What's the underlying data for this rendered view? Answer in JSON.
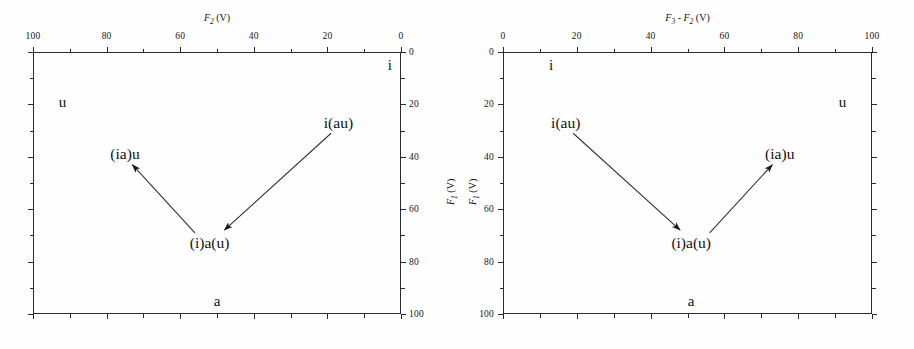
{
  "figure": {
    "background": "#fefefe",
    "ink": "#1a1a1a"
  },
  "chart_data": {
    "type": "scatter",
    "title": "",
    "grid": false,
    "legend": null,
    "panels": [
      {
        "id": "left",
        "xlabel": "F2 (V)",
        "xlabel_parts": {
          "symbol": "F",
          "sub": "2",
          "unit": "(V)"
        },
        "ylabel": "F1 (V)",
        "ylabel_parts": {
          "symbol": "F",
          "sub": "1",
          "unit": "(V)"
        },
        "xaxis_position": "top",
        "yaxis_position": "right",
        "xlim": [
          100,
          0
        ],
        "ylim": [
          0,
          100
        ],
        "x_reversed": true,
        "xticks": [
          100,
          80,
          60,
          40,
          20,
          0
        ],
        "yticks": [
          0,
          20,
          40,
          60,
          80,
          100
        ],
        "minor_tick_step": 10,
        "corner_labels": [
          {
            "text": "i",
            "x": 97,
            "y": 5
          },
          {
            "text": "u",
            "x": 8,
            "y": 19
          },
          {
            "text": "a",
            "x": 50,
            "y": 95
          }
        ],
        "points": [
          {
            "label": "i(au)",
            "x": 83,
            "y": 27
          },
          {
            "label": "(i)a(u)",
            "x": 48,
            "y": 73
          },
          {
            "label": "(ia)u",
            "x": 25,
            "y": 39
          }
        ],
        "arrows": [
          {
            "from": "i(au)",
            "to": "(i)a(u)",
            "x1": 81,
            "y1": 31,
            "x2": 52,
            "y2": 68
          },
          {
            "from": "(i)a(u)",
            "to": "(ia)u",
            "x1": 44,
            "y1": 69,
            "x2": 27,
            "y2": 43
          }
        ]
      },
      {
        "id": "right",
        "xlabel": "F3 - F2 (V)",
        "xlabel_parts": {
          "symbol1": "F",
          "sub1": "3",
          "op": "-",
          "symbol2": "F",
          "sub2": "2",
          "unit": "(V)"
        },
        "ylabel": "F1 (V)",
        "ylabel_parts": {
          "symbol": "F",
          "sub": "1",
          "unit": "(V)"
        },
        "xaxis_position": "top",
        "yaxis_position": "left",
        "xlim": [
          0,
          100
        ],
        "ylim": [
          0,
          100
        ],
        "x_reversed": false,
        "xticks": [
          0,
          20,
          40,
          60,
          80,
          100
        ],
        "yticks": [
          0,
          20,
          40,
          60,
          80,
          100
        ],
        "minor_tick_step": 10,
        "corner_labels": [
          {
            "text": "i",
            "x": 13,
            "y": 5
          },
          {
            "text": "u",
            "x": 92,
            "y": 19
          },
          {
            "text": "a",
            "x": 51,
            "y": 95
          }
        ],
        "points": [
          {
            "label": "i(au)",
            "x": 17,
            "y": 27
          },
          {
            "label": "(i)a(u)",
            "x": 51,
            "y": 73
          },
          {
            "label": "(ia)u",
            "x": 75,
            "y": 39
          }
        ],
        "arrows": [
          {
            "from": "i(au)",
            "to": "(i)a(u)",
            "x1": 19,
            "y1": 31,
            "x2": 48,
            "y2": 68
          },
          {
            "from": "(i)a(u)",
            "to": "(ia)u",
            "x1": 56,
            "y1": 69,
            "x2": 73,
            "y2": 43
          }
        ]
      }
    ]
  }
}
